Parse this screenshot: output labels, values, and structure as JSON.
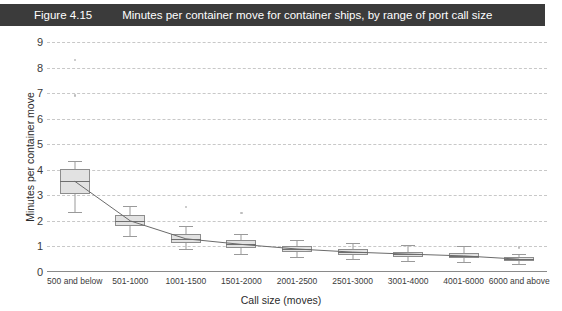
{
  "figure": {
    "number": "Figure 4.15",
    "title": "Minutes per container move for container ships, by range of port call size"
  },
  "chart_data": {
    "type": "boxplot",
    "title": "Minutes per container move for container ships, by range of port call size",
    "xlabel": "Call size (moves)",
    "ylabel": "Minutes per container move",
    "ylim": [
      0,
      9
    ],
    "yticks": [
      0,
      1,
      2,
      3,
      4,
      5,
      6,
      7,
      8,
      9
    ],
    "grid": true,
    "legend": "none",
    "categories": [
      "500 and below",
      "501-1000",
      "1001-1500",
      "1501-2000",
      "2001-2500",
      "2501-3000",
      "3001-4000",
      "4001-6000",
      "6000 and above"
    ],
    "boxes": [
      {
        "category": "500 and below",
        "whisker_low": 2.35,
        "q1": 3.05,
        "median": 3.55,
        "q3": 4.05,
        "whisker_high": 4.35,
        "outliers": [
          6.9,
          8.3
        ]
      },
      {
        "category": "501-1000",
        "whisker_low": 1.4,
        "q1": 1.8,
        "median": 2.0,
        "q3": 2.25,
        "whisker_high": 2.6,
        "outliers": []
      },
      {
        "category": "1001-1500",
        "whisker_low": 0.9,
        "q1": 1.15,
        "median": 1.3,
        "q3": 1.5,
        "whisker_high": 1.8,
        "outliers": [
          2.55
        ]
      },
      {
        "category": "1501-2000",
        "whisker_low": 0.7,
        "q1": 0.95,
        "median": 1.08,
        "q3": 1.25,
        "whisker_high": 1.5,
        "outliers": [
          2.3
        ]
      },
      {
        "category": "2001-2500",
        "whisker_low": 0.58,
        "q1": 0.8,
        "median": 0.9,
        "q3": 1.02,
        "whisker_high": 1.25,
        "outliers": []
      },
      {
        "category": "2501-3000",
        "whisker_low": 0.5,
        "q1": 0.68,
        "median": 0.78,
        "q3": 0.9,
        "whisker_high": 1.15,
        "outliers": []
      },
      {
        "category": "3001-4000",
        "whisker_low": 0.42,
        "q1": 0.6,
        "median": 0.7,
        "q3": 0.8,
        "whisker_high": 1.05,
        "outliers": []
      },
      {
        "category": "4001-6000",
        "whisker_low": 0.38,
        "q1": 0.55,
        "median": 0.63,
        "q3": 0.75,
        "whisker_high": 1.0,
        "outliers": []
      },
      {
        "category": "6000 and above",
        "whisker_low": 0.3,
        "q1": 0.42,
        "median": 0.5,
        "q3": 0.6,
        "whisker_high": 0.72,
        "outliers": [
          0.95
        ]
      }
    ],
    "median_trend": [
      3.55,
      2.0,
      1.3,
      1.08,
      0.9,
      0.78,
      0.7,
      0.63,
      0.5
    ]
  },
  "colors": {
    "title_bar": "#3b3b3b",
    "title_text": "#ffffff",
    "box_fill": "#e2e2e2",
    "box_border": "#8d8d8d",
    "gridline": "#c8c8c8",
    "axis": "#8a8a8a",
    "trend_line": "#6b6b6b"
  }
}
